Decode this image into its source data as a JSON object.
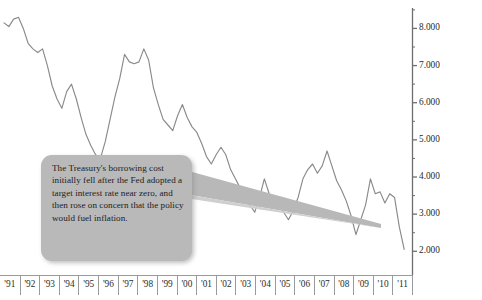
{
  "callout": {
    "text": "The Treasury's borrowing cost initially fell after the Fed adopted a target interest rate near zero, and then rose on concern that the policy would fuel inflation."
  },
  "chart_data": {
    "type": "line",
    "title": "",
    "subtitle": "",
    "xlabel": "",
    "ylabel": "",
    "grid": false,
    "legend": "none",
    "y_axis_position": "right",
    "x_axis_position": "bottom",
    "line_color": "#8a8a8a",
    "background_color": "#ffffff",
    "axis_color": "#6e6e6e",
    "ylim": [
      1.55,
      8.55
    ],
    "yticks": [
      2.0,
      3.0,
      4.0,
      5.0,
      6.0,
      7.0,
      8.0
    ],
    "ytick_labels": [
      "2.000",
      "3.000",
      "4.000",
      "5.000",
      "6.000",
      "7.000",
      "8.000"
    ],
    "minor_yticks": [
      2.5,
      3.5,
      4.5,
      5.5,
      6.5,
      7.5,
      8.5
    ],
    "xtick_labels": [
      "'91",
      "'92",
      "'93",
      "'94",
      "'95",
      "'96",
      "'97",
      "'98",
      "'99",
      "'00",
      "'01",
      "'02",
      "'03",
      "'04",
      "'05",
      "'06",
      "'07",
      "'08",
      "'09",
      "'10",
      "'11"
    ],
    "xlim": [
      1991.0,
      2012.0
    ],
    "x": [
      1991.0,
      1991.25,
      1991.5,
      1991.75,
      1992.0,
      1992.25,
      1992.5,
      1992.75,
      1993.0,
      1993.25,
      1993.5,
      1993.75,
      1994.0,
      1994.25,
      1994.5,
      1994.75,
      1995.0,
      1995.25,
      1995.5,
      1995.75,
      1996.0,
      1996.25,
      1996.5,
      1996.75,
      1997.0,
      1997.25,
      1997.5,
      1997.75,
      1998.0,
      1998.25,
      1998.5,
      1998.75,
      1999.0,
      1999.25,
      1999.5,
      1999.75,
      2000.0,
      2000.25,
      2000.5,
      2000.75,
      2001.0,
      2001.25,
      2001.5,
      2001.75,
      2002.0,
      2002.25,
      2002.5,
      2002.75,
      2003.0,
      2003.25,
      2003.5,
      2003.75,
      2004.0,
      2004.25,
      2004.5,
      2004.75,
      2005.0,
      2005.25,
      2005.5,
      2005.75,
      2006.0,
      2006.25,
      2006.5,
      2006.75,
      2007.0,
      2007.25,
      2007.5,
      2007.75,
      2008.0,
      2008.25,
      2008.5,
      2008.75,
      2009.0,
      2009.25,
      2009.5,
      2009.75,
      2010.0,
      2010.25,
      2010.5,
      2010.75,
      2011.0,
      2011.25,
      2011.5,
      2011.75
    ],
    "values": [
      8.15,
      8.05,
      8.25,
      8.3,
      8.0,
      7.6,
      7.45,
      7.35,
      7.45,
      7.0,
      6.45,
      6.1,
      5.85,
      6.3,
      6.5,
      6.1,
      5.6,
      5.15,
      4.85,
      4.6,
      4.5,
      4.95,
      5.55,
      6.15,
      6.65,
      7.3,
      7.1,
      7.05,
      7.1,
      7.45,
      7.15,
      6.4,
      5.95,
      5.55,
      5.4,
      5.25,
      5.65,
      5.95,
      5.6,
      5.35,
      5.2,
      4.9,
      4.55,
      4.35,
      4.6,
      4.8,
      4.6,
      4.2,
      3.95,
      3.7,
      3.55,
      3.25,
      3.05,
      3.45,
      3.95,
      3.55,
      3.35,
      3.25,
      3.05,
      2.85,
      3.1,
      3.45,
      3.95,
      4.2,
      4.35,
      4.1,
      4.3,
      4.7,
      4.3,
      3.9,
      3.65,
      3.35,
      2.95,
      2.45,
      2.85,
      3.25,
      3.95,
      3.55,
      3.6,
      3.3,
      3.55,
      3.45,
      2.65,
      2.05
    ],
    "series_name": "Treasury borrowing cost (yield, %)",
    "annotations": [
      {
        "text": "The Treasury's borrowing cost initially fell after the Fed adopted a target interest rate near zero, and then rose on concern that the policy would fuel inflation.",
        "points_to_x": 2008.6,
        "points_to_y": 3.0
      }
    ]
  }
}
